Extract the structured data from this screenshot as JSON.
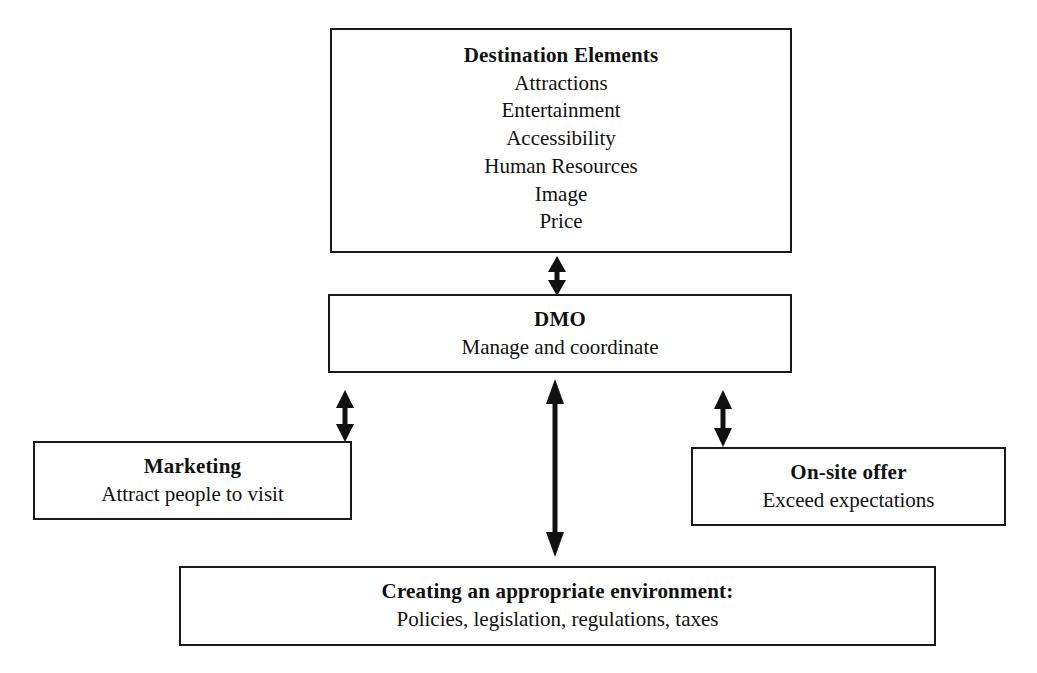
{
  "diagram": {
    "title_text": "",
    "stroke_color": "#1a1a1a",
    "background_color": "#fefefe",
    "boxes": {
      "destination": {
        "heading": "Destination Elements",
        "items": [
          "Attractions",
          "Entertainment",
          "Accessibility",
          "Human Resources",
          "Image",
          "Price"
        ]
      },
      "dmo": {
        "heading": "DMO",
        "subtitle": "Manage and coordinate"
      },
      "marketing": {
        "heading": "Marketing",
        "subtitle": "Attract people to visit"
      },
      "onsite": {
        "heading": "On-site offer",
        "subtitle": "Exceed expectations"
      },
      "environment": {
        "heading": "Creating an appropriate environment:",
        "subtitle": "Policies, legislation, regulations, taxes"
      }
    },
    "connectors": [
      {
        "name": "destination-dmo",
        "from": "destination",
        "to": "dmo",
        "style": "double-headed-vertical"
      },
      {
        "name": "dmo-marketing",
        "from": "dmo",
        "to": "marketing",
        "style": "double-headed-vertical"
      },
      {
        "name": "dmo-environment",
        "from": "dmo",
        "to": "environment",
        "style": "double-headed-vertical"
      },
      {
        "name": "dmo-onsite",
        "from": "dmo",
        "to": "onsite",
        "style": "double-headed-vertical"
      }
    ]
  }
}
